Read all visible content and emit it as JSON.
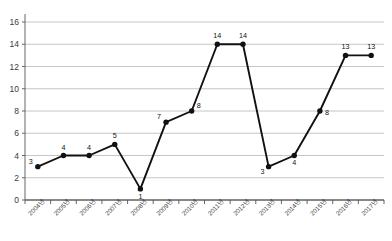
{
  "chart_data": {
    "type": "line",
    "title": "",
    "subtitle": "",
    "xlabel": "",
    "ylabel": "",
    "categories": [
      "2004년",
      "2005년",
      "2006년",
      "2007년",
      "2008년",
      "2009년",
      "2010년",
      "2011년",
      "2012년",
      "2013년",
      "2014년",
      "2015년",
      "2016년",
      "2017년"
    ],
    "values": [
      3,
      4,
      4,
      5,
      1,
      7,
      8,
      14,
      14,
      3,
      4,
      8,
      13,
      13
    ],
    "point_labels": [
      "3",
      "4",
      "4",
      "5",
      "1",
      "7",
      "8",
      "14",
      "14",
      "3",
      "4",
      "8",
      "13",
      "13"
    ],
    "series": [
      {
        "name": "",
        "values": [
          3,
          4,
          4,
          5,
          1,
          7,
          8,
          14,
          14,
          3,
          4,
          8,
          13,
          13
        ]
      }
    ],
    "ylim": [
      0,
      16
    ],
    "ytick_values": [
      0,
      2,
      4,
      6,
      8,
      10,
      12,
      14,
      16
    ],
    "ytick_labels": [
      "0",
      "2",
      "4",
      "6",
      "8",
      "10",
      "12",
      "14",
      "16"
    ],
    "grid": "horizontal",
    "legend": "none",
    "marker": "circle",
    "line_color": "#111111",
    "marker_color": "#111111",
    "grid_color": "#b8b8b8",
    "axis_color": "#555555",
    "background_color": "#ffffff",
    "xtick_rotation": -45
  }
}
